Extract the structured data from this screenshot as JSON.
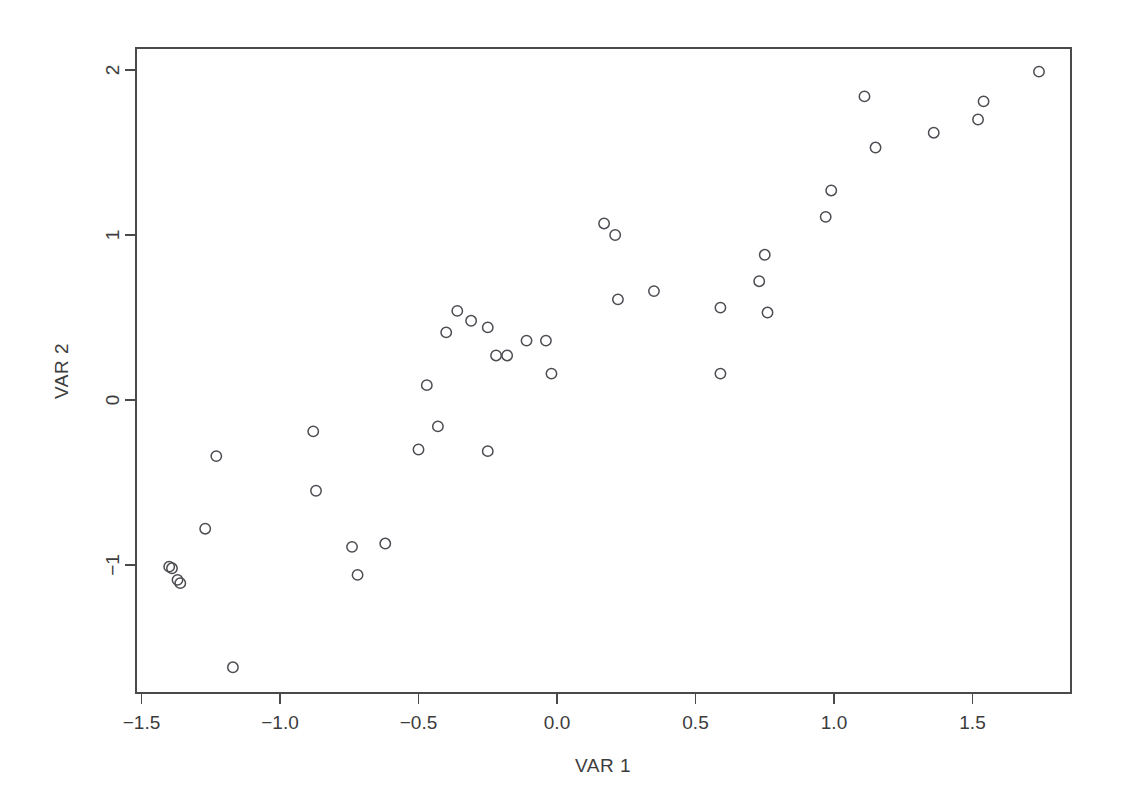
{
  "figure": {
    "background_color": "#ffffff",
    "foreground_color": "#3c3c3c",
    "point_stroke_color": "#4c4c52",
    "axis_color": "#4a4a4a"
  },
  "chart_data": {
    "type": "scatter",
    "title": "",
    "xlabel": "VAR 1",
    "ylabel": "VAR 2",
    "xlim": [
      -1.52,
      1.85
    ],
    "ylim": [
      -1.78,
      2.06
    ],
    "grid": false,
    "legend": null,
    "xticks": [
      -1.5,
      -1.0,
      -0.5,
      0.0,
      0.5,
      1.0,
      1.5
    ],
    "xtick_labels": [
      "-1.5",
      "-1.0",
      "-0.5",
      "0.0",
      "0.5",
      "1.0",
      "1.5"
    ],
    "yticks": [
      -1,
      0,
      1,
      2
    ],
    "ytick_labels": [
      "-1",
      "0",
      "1",
      "2"
    ],
    "marker": "open-circle",
    "n_points": 44,
    "x": [
      -1.4,
      -1.39,
      -1.38,
      -1.37,
      -1.27,
      -1.23,
      -1.17,
      -0.88,
      -0.87,
      -0.74,
      -0.72,
      -0.62,
      -0.5,
      -0.47,
      -0.43,
      -0.4,
      -0.36,
      -0.31,
      -0.25,
      -0.25,
      -0.22,
      -0.18,
      -0.11,
      -0.04,
      -0.02,
      0.17,
      0.2,
      0.22,
      0.23,
      0.35,
      0.59,
      0.59,
      0.73,
      0.75,
      0.76,
      0.76,
      0.97,
      0.99,
      1.11,
      1.15,
      1.36,
      1.52,
      1.54,
      1.74
    ],
    "y": [
      -1.01,
      -1.01,
      -1.09,
      -1.1,
      -0.78,
      -0.34,
      -1.62,
      -0.19,
      -0.55,
      -0.89,
      -1.06,
      -0.87,
      -0.3,
      0.09,
      -0.16,
      0.41,
      0.54,
      0.48,
      0.44,
      -0.31,
      0.27,
      0.27,
      0.36,
      0.36,
      0.16,
      1.07,
      1.0,
      0.61,
      1.0,
      0.66,
      0.56,
      0.16,
      0.72,
      0.88,
      0.53,
      0.53,
      1.11,
      1.27,
      1.84,
      1.53,
      1.62,
      1.7,
      1.81,
      1.99
    ],
    "points": [
      {
        "x": -1.4,
        "y": -1.01
      },
      {
        "x": -1.39,
        "y": -1.02
      },
      {
        "x": -1.37,
        "y": -1.09
      },
      {
        "x": -1.36,
        "y": -1.11
      },
      {
        "x": -1.27,
        "y": -0.78
      },
      {
        "x": -1.23,
        "y": -0.34
      },
      {
        "x": -1.17,
        "y": -1.62
      },
      {
        "x": -0.88,
        "y": -0.19
      },
      {
        "x": -0.87,
        "y": -0.55
      },
      {
        "x": -0.74,
        "y": -0.89
      },
      {
        "x": -0.72,
        "y": -1.06
      },
      {
        "x": -0.62,
        "y": -0.87
      },
      {
        "x": -0.5,
        "y": -0.3
      },
      {
        "x": -0.47,
        "y": 0.09
      },
      {
        "x": -0.43,
        "y": -0.16
      },
      {
        "x": -0.4,
        "y": 0.41
      },
      {
        "x": -0.36,
        "y": 0.54
      },
      {
        "x": -0.31,
        "y": 0.48
      },
      {
        "x": -0.25,
        "y": 0.44
      },
      {
        "x": -0.25,
        "y": -0.31
      },
      {
        "x": -0.22,
        "y": 0.27
      },
      {
        "x": -0.18,
        "y": 0.27
      },
      {
        "x": -0.11,
        "y": 0.36
      },
      {
        "x": -0.04,
        "y": 0.36
      },
      {
        "x": -0.02,
        "y": 0.16
      },
      {
        "x": 0.17,
        "y": 1.07
      },
      {
        "x": 0.21,
        "y": 1.0
      },
      {
        "x": 0.22,
        "y": 0.61
      },
      {
        "x": 0.35,
        "y": 0.66
      },
      {
        "x": 0.59,
        "y": 0.56
      },
      {
        "x": 0.59,
        "y": 0.16
      },
      {
        "x": 0.73,
        "y": 0.72
      },
      {
        "x": 0.75,
        "y": 0.88
      },
      {
        "x": 0.76,
        "y": 0.53
      },
      {
        "x": 0.97,
        "y": 1.11
      },
      {
        "x": 0.99,
        "y": 1.27
      },
      {
        "x": 1.11,
        "y": 1.84
      },
      {
        "x": 1.15,
        "y": 1.53
      },
      {
        "x": 1.36,
        "y": 1.62
      },
      {
        "x": 1.52,
        "y": 1.7
      },
      {
        "x": 1.54,
        "y": 1.81
      },
      {
        "x": 1.74,
        "y": 1.99
      }
    ]
  }
}
